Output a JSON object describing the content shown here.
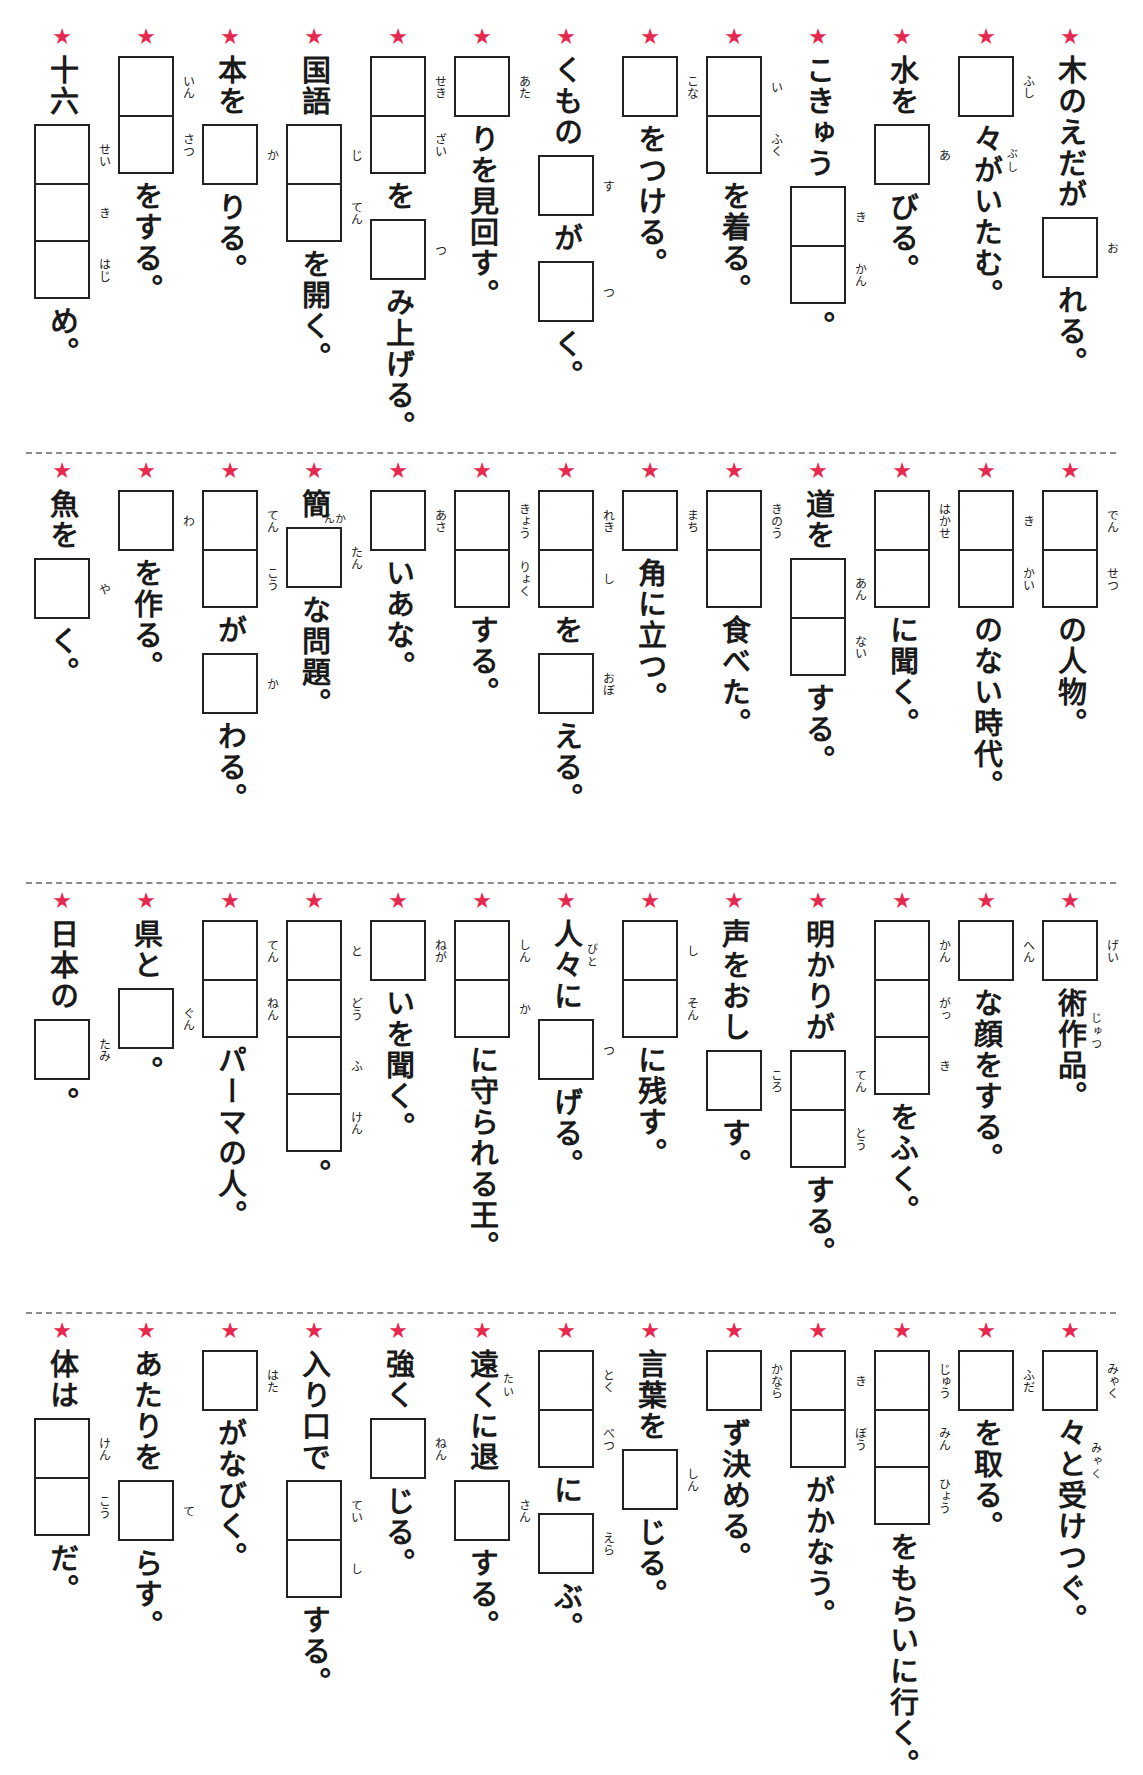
{
  "worksheet": {
    "star_color": "#e8294f",
    "rows": [
      {
        "columns": [
          {
            "segments": [
              {
                "t": "text",
                "v": "木のえだが"
              },
              {
                "t": "box",
                "furi": [
                  "お"
                ]
              },
              {
                "t": "text",
                "v": "れる。"
              }
            ]
          },
          {
            "segments": [
              {
                "t": "box",
                "furi": [
                  "ふし"
                ]
              },
              {
                "t": "text",
                "v": "々がいたむ。",
                "ruby": "ぶし"
              }
            ]
          },
          {
            "segments": [
              {
                "t": "text",
                "v": "水を"
              },
              {
                "t": "box",
                "furi": [
                  "あ"
                ]
              },
              {
                "t": "text",
                "v": "びる。"
              }
            ]
          },
          {
            "segments": [
              {
                "t": "text",
                "v": "こきゅう"
              },
              {
                "t": "box",
                "furi": [
                  "き",
                  "かん"
                ]
              },
              {
                "t": "text",
                "v": "。"
              }
            ]
          },
          {
            "segments": [
              {
                "t": "box",
                "furi": [
                  "い",
                  "ふく"
                ]
              },
              {
                "t": "text",
                "v": "を着る。"
              }
            ]
          },
          {
            "segments": [
              {
                "t": "box",
                "furi": [
                  "こな"
                ]
              },
              {
                "t": "text",
                "v": "をつける。"
              }
            ]
          },
          {
            "segments": [
              {
                "t": "text",
                "v": "くもの"
              },
              {
                "t": "box",
                "furi": [
                  "す"
                ]
              },
              {
                "t": "text",
                "v": "が"
              },
              {
                "t": "box",
                "furi": [
                  "つ"
                ]
              },
              {
                "t": "text",
                "v": "く。"
              }
            ]
          },
          {
            "segments": [
              {
                "t": "box",
                "furi": [
                  "あた"
                ]
              },
              {
                "t": "text",
                "v": "りを見回す。"
              }
            ]
          },
          {
            "segments": [
              {
                "t": "box",
                "furi": [
                  "せき",
                  "ざい"
                ]
              },
              {
                "t": "text",
                "v": "を"
              },
              {
                "t": "box",
                "furi": [
                  "つ"
                ]
              },
              {
                "t": "text",
                "v": "み上げる。"
              }
            ]
          },
          {
            "segments": [
              {
                "t": "text",
                "v": "国語"
              },
              {
                "t": "box",
                "furi": [
                  "じ",
                  "てん"
                ]
              },
              {
                "t": "text",
                "v": "を開く。"
              }
            ]
          },
          {
            "segments": [
              {
                "t": "text",
                "v": "本を"
              },
              {
                "t": "box",
                "furi": [
                  "か"
                ]
              },
              {
                "t": "text",
                "v": "りる。"
              }
            ]
          },
          {
            "segments": [
              {
                "t": "box",
                "furi": [
                  "いん",
                  "さつ"
                ]
              },
              {
                "t": "text",
                "v": "をする。"
              }
            ]
          },
          {
            "segments": [
              {
                "t": "text",
                "v": "十六"
              },
              {
                "t": "box",
                "furi": [
                  "せい",
                  "き",
                  "はじ"
                ]
              },
              {
                "t": "text",
                "v": "め。"
              }
            ]
          }
        ]
      },
      {
        "columns": [
          {
            "segments": [
              {
                "t": "box",
                "furi": [
                  "でん",
                  "せつ"
                ]
              },
              {
                "t": "text",
                "v": "の人物。"
              }
            ]
          },
          {
            "segments": [
              {
                "t": "box",
                "furi": [
                  "き",
                  "かい"
                ]
              },
              {
                "t": "text",
                "v": "のない時代。"
              }
            ]
          },
          {
            "segments": [
              {
                "t": "box",
                "furi": [
                  "はかせ",
                  ""
                ]
              },
              {
                "t": "text",
                "v": "に聞く。"
              }
            ]
          },
          {
            "segments": [
              {
                "t": "text",
                "v": "道を"
              },
              {
                "t": "box",
                "furi": [
                  "あん",
                  "ない"
                ]
              },
              {
                "t": "text",
                "v": "する。"
              }
            ]
          },
          {
            "segments": [
              {
                "t": "box",
                "furi": [
                  "きのう",
                  ""
                ]
              },
              {
                "t": "text",
                "v": "食べた。"
              }
            ]
          },
          {
            "segments": [
              {
                "t": "box",
                "furi": [
                  "まち"
                ]
              },
              {
                "t": "text",
                "v": "角に立つ。"
              }
            ]
          },
          {
            "segments": [
              {
                "t": "box",
                "furi": [
                  "れき",
                  "し"
                ]
              },
              {
                "t": "text",
                "v": "を"
              },
              {
                "t": "box",
                "furi": [
                  "おぼ"
                ]
              },
              {
                "t": "text",
                "v": "える。"
              }
            ]
          },
          {
            "segments": [
              {
                "t": "box",
                "furi": [
                  "きょう",
                  "りょく"
                ]
              },
              {
                "t": "text",
                "v": "する。"
              }
            ]
          },
          {
            "segments": [
              {
                "t": "box",
                "furi": [
                  "あさ"
                ]
              },
              {
                "t": "text",
                "v": "いあな。"
              }
            ]
          },
          {
            "segments": [
              {
                "t": "text",
                "v": "簡",
                "ruby": "かん"
              },
              {
                "t": "box",
                "furi": [
                  "たん"
                ]
              },
              {
                "t": "text",
                "v": "な問題。"
              }
            ]
          },
          {
            "segments": [
              {
                "t": "box",
                "furi": [
                  "てん",
                  "こう"
                ]
              },
              {
                "t": "text",
                "v": "が"
              },
              {
                "t": "box",
                "furi": [
                  "か"
                ]
              },
              {
                "t": "text",
                "v": "わる。"
              }
            ]
          },
          {
            "segments": [
              {
                "t": "box",
                "furi": [
                  "わ"
                ]
              },
              {
                "t": "text",
                "v": "を作る。"
              }
            ]
          },
          {
            "segments": [
              {
                "t": "text",
                "v": "魚を"
              },
              {
                "t": "box",
                "furi": [
                  "や"
                ]
              },
              {
                "t": "text",
                "v": "く。"
              }
            ]
          }
        ]
      },
      {
        "columns": [
          {
            "segments": [
              {
                "t": "box",
                "furi": [
                  "げい"
                ]
              },
              {
                "t": "text",
                "v": "術作品。",
                "ruby": "じゅつ"
              }
            ]
          },
          {
            "segments": [
              {
                "t": "box",
                "furi": [
                  "へん"
                ]
              },
              {
                "t": "text",
                "v": "な顔をする。"
              }
            ]
          },
          {
            "segments": [
              {
                "t": "box",
                "furi": [
                  "かん",
                  "がっ",
                  "き"
                ]
              },
              {
                "t": "text",
                "v": "をふく。"
              }
            ]
          },
          {
            "segments": [
              {
                "t": "text",
                "v": "明かりが"
              },
              {
                "t": "box",
                "furi": [
                  "てん",
                  "とう"
                ]
              },
              {
                "t": "text",
                "v": "する。"
              }
            ]
          },
          {
            "segments": [
              {
                "t": "text",
                "v": "声をおし"
              },
              {
                "t": "box",
                "furi": [
                  "ころ"
                ]
              },
              {
                "t": "text",
                "v": "す。"
              }
            ]
          },
          {
            "segments": [
              {
                "t": "box",
                "furi": [
                  "し",
                  "そん"
                ]
              },
              {
                "t": "text",
                "v": "に残す。"
              }
            ]
          },
          {
            "segments": [
              {
                "t": "text",
                "v": "人々に",
                "ruby": "びと"
              },
              {
                "t": "box",
                "furi": [
                  "つ"
                ]
              },
              {
                "t": "text",
                "v": "げる。"
              }
            ]
          },
          {
            "segments": [
              {
                "t": "box",
                "furi": [
                  "しん",
                  "か"
                ]
              },
              {
                "t": "text",
                "v": "に守られる王。"
              }
            ]
          },
          {
            "segments": [
              {
                "t": "box",
                "furi": [
                  "ねが"
                ]
              },
              {
                "t": "text",
                "v": "いを聞く。"
              }
            ]
          },
          {
            "segments": [
              {
                "t": "box",
                "furi": [
                  "と",
                  "どう",
                  "ふ",
                  "けん"
                ]
              },
              {
                "t": "text",
                "v": "。"
              }
            ]
          },
          {
            "segments": [
              {
                "t": "box",
                "furi": [
                  "てん",
                  "ねん"
                ]
              },
              {
                "t": "text",
                "v": "パーマの人。"
              }
            ]
          },
          {
            "segments": [
              {
                "t": "text",
                "v": "県と"
              },
              {
                "t": "box",
                "furi": [
                  "ぐん"
                ]
              },
              {
                "t": "text",
                "v": "。"
              }
            ]
          },
          {
            "segments": [
              {
                "t": "text",
                "v": "日本の"
              },
              {
                "t": "box",
                "furi": [
                  "たみ"
                ]
              },
              {
                "t": "text",
                "v": "。"
              }
            ]
          }
        ]
      },
      {
        "columns": [
          {
            "segments": [
              {
                "t": "box",
                "furi": [
                  "みゃく"
                ]
              },
              {
                "t": "text",
                "v": "々と受けつぐ。",
                "ruby": "みゃく"
              }
            ]
          },
          {
            "segments": [
              {
                "t": "box",
                "furi": [
                  "ふだ"
                ]
              },
              {
                "t": "text",
                "v": "を取る。"
              }
            ]
          },
          {
            "segments": [
              {
                "t": "box",
                "furi": [
                  "じゅう",
                  "みん",
                  "ひょう"
                ]
              },
              {
                "t": "text",
                "v": "をもらいに行く。"
              }
            ]
          },
          {
            "segments": [
              {
                "t": "box",
                "furi": [
                  "き",
                  "ぼう"
                ]
              },
              {
                "t": "text",
                "v": "がかなう。"
              }
            ]
          },
          {
            "segments": [
              {
                "t": "box",
                "furi": [
                  "かなら"
                ]
              },
              {
                "t": "text",
                "v": "ず決める。"
              }
            ]
          },
          {
            "segments": [
              {
                "t": "text",
                "v": "言葉を"
              },
              {
                "t": "box",
                "furi": [
                  "しん"
                ]
              },
              {
                "t": "text",
                "v": "じる。"
              }
            ]
          },
          {
            "segments": [
              {
                "t": "box",
                "furi": [
                  "とく",
                  "べつ"
                ]
              },
              {
                "t": "text",
                "v": "に"
              },
              {
                "t": "box",
                "furi": [
                  "えら"
                ]
              },
              {
                "t": "text",
                "v": "ぶ。"
              }
            ]
          },
          {
            "segments": [
              {
                "t": "text",
                "v": "遠くに退",
                "ruby": "たい"
              },
              {
                "t": "box",
                "furi": [
                  "さん"
                ]
              },
              {
                "t": "text",
                "v": "する。"
              }
            ]
          },
          {
            "segments": [
              {
                "t": "text",
                "v": "強く"
              },
              {
                "t": "box",
                "furi": [
                  "ねん"
                ]
              },
              {
                "t": "text",
                "v": "じる。"
              }
            ]
          },
          {
            "segments": [
              {
                "t": "text",
                "v": "入り口で"
              },
              {
                "t": "box",
                "furi": [
                  "てい",
                  "し"
                ]
              },
              {
                "t": "text",
                "v": "する。"
              }
            ]
          },
          {
            "segments": [
              {
                "t": "box",
                "furi": [
                  "はた"
                ]
              },
              {
                "t": "text",
                "v": "がなびく。"
              }
            ]
          },
          {
            "segments": [
              {
                "t": "text",
                "v": "あたりを"
              },
              {
                "t": "box",
                "furi": [
                  "て"
                ]
              },
              {
                "t": "text",
                "v": "らす。"
              }
            ]
          },
          {
            "segments": [
              {
                "t": "text",
                "v": "体は"
              },
              {
                "t": "box",
                "furi": [
                  "けん",
                  "こう"
                ]
              },
              {
                "t": "text",
                "v": "だ。"
              }
            ]
          }
        ]
      }
    ],
    "star_glyph": "★"
  }
}
